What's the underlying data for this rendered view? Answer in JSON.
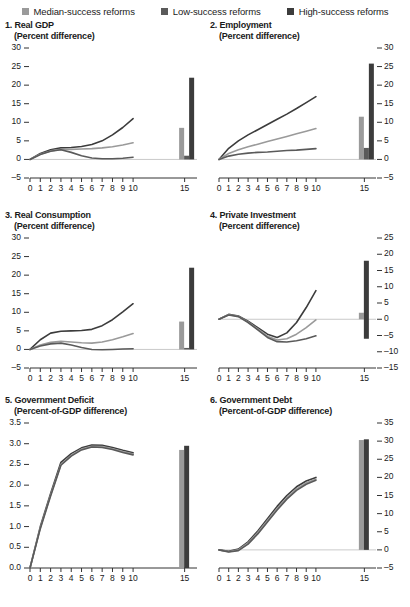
{
  "legend": {
    "items": [
      {
        "label": "Median-success reforms",
        "color": "#9a9a9a",
        "icon": "square-swatch"
      },
      {
        "label": "Low-success reforms",
        "color": "#5a5a5a",
        "icon": "square-swatch"
      },
      {
        "label": "High-success reforms",
        "color": "#3c3c3c",
        "icon": "square-swatch"
      }
    ]
  },
  "chart_data": [
    {
      "type": "line",
      "panel_number": "1.",
      "title": "Real GDP",
      "subtitle": "(Percent difference)",
      "xlabel": "",
      "ylabel": "",
      "axis_side": "left",
      "ylim": [
        -5,
        30
      ],
      "yticks": [
        -5,
        0,
        5,
        10,
        15,
        20,
        25,
        30
      ],
      "ytick_labels": [
        "–5",
        "0",
        "5",
        "10",
        "15",
        "20",
        "25",
        "30"
      ],
      "x": [
        0,
        1,
        2,
        3,
        4,
        5,
        6,
        7,
        8,
        9,
        10
      ],
      "xtick_labels": [
        "0",
        "1",
        "2",
        "3",
        "4",
        "5",
        "6",
        "7",
        "8",
        "9",
        "10",
        "15"
      ],
      "grid": false,
      "legend_position": "top",
      "series": [
        {
          "name": "High-success reforms",
          "color": "#3c3c3c",
          "values": [
            0.0,
            1.6,
            2.6,
            3.1,
            3.2,
            3.5,
            4.0,
            5.0,
            6.6,
            8.6,
            11.0
          ]
        },
        {
          "name": "Median-success reforms",
          "color": "#9a9a9a",
          "values": [
            0.0,
            1.4,
            2.3,
            2.7,
            2.7,
            2.8,
            2.9,
            3.1,
            3.4,
            3.9,
            4.5
          ]
        },
        {
          "name": "Low-success reforms",
          "color": "#5a5a5a",
          "values": [
            0.0,
            1.3,
            2.2,
            2.6,
            1.9,
            1.0,
            0.4,
            0.2,
            0.2,
            0.3,
            0.6
          ]
        }
      ],
      "bars": [
        {
          "name": "Median-success reforms",
          "x": 15,
          "value": 8.5,
          "color": "#9a9a9a"
        },
        {
          "name": "Low-success reforms",
          "x": 15,
          "value": 1.0,
          "color": "#5a5a5a"
        },
        {
          "name": "High-success reforms",
          "x": 15,
          "value": 22.0,
          "color": "#3c3c3c"
        }
      ]
    },
    {
      "type": "line",
      "panel_number": "2.",
      "title": "Employment",
      "subtitle": "(Percent difference)",
      "xlabel": "",
      "ylabel": "",
      "axis_side": "right",
      "ylim": [
        -5,
        30
      ],
      "yticks": [
        -5,
        0,
        5,
        10,
        15,
        20,
        25,
        30
      ],
      "ytick_labels": [
        "–5",
        "0",
        "5",
        "10",
        "15",
        "20",
        "25",
        "30"
      ],
      "x": [
        0,
        1,
        2,
        3,
        4,
        5,
        6,
        7,
        8,
        9,
        10
      ],
      "xtick_labels": [
        "0",
        "1",
        "2",
        "3",
        "4",
        "5",
        "6",
        "7",
        "8",
        "9",
        "10",
        "15"
      ],
      "grid": false,
      "legend_position": "top",
      "series": [
        {
          "name": "High-success reforms",
          "color": "#3c3c3c",
          "values": [
            0.0,
            3.0,
            5.0,
            6.6,
            8.0,
            9.4,
            10.8,
            12.2,
            13.7,
            15.3,
            16.9
          ]
        },
        {
          "name": "Median-success reforms",
          "color": "#9a9a9a",
          "values": [
            0.0,
            1.6,
            2.6,
            3.4,
            4.1,
            4.8,
            5.5,
            6.2,
            6.9,
            7.6,
            8.3
          ]
        },
        {
          "name": "Low-success reforms",
          "color": "#5a5a5a",
          "values": [
            0.0,
            0.9,
            1.4,
            1.7,
            1.9,
            2.0,
            2.2,
            2.4,
            2.5,
            2.7,
            2.9
          ]
        }
      ],
      "bars": [
        {
          "name": "Median-success reforms",
          "x": 15,
          "value": 11.5,
          "color": "#9a9a9a"
        },
        {
          "name": "Low-success reforms",
          "x": 15,
          "value": 3.1,
          "color": "#5a5a5a"
        },
        {
          "name": "High-success reforms",
          "x": 15,
          "value": 25.8,
          "color": "#3c3c3c"
        }
      ]
    },
    {
      "type": "line",
      "panel_number": "3.",
      "title": "Real Consumption",
      "subtitle": "(Percent difference)",
      "xlabel": "",
      "ylabel": "",
      "axis_side": "left",
      "ylim": [
        -5,
        30
      ],
      "yticks": [
        -5,
        0,
        5,
        10,
        15,
        20,
        25,
        30
      ],
      "ytick_labels": [
        "–5",
        "0",
        "5",
        "10",
        "15",
        "20",
        "25",
        "30"
      ],
      "x": [
        0,
        1,
        2,
        3,
        4,
        5,
        6,
        7,
        8,
        9,
        10
      ],
      "xtick_labels": [
        "0",
        "1",
        "2",
        "3",
        "4",
        "5",
        "6",
        "7",
        "8",
        "9",
        "10",
        "15"
      ],
      "grid": false,
      "legend_position": "top",
      "series": [
        {
          "name": "High-success reforms",
          "color": "#3c3c3c",
          "values": [
            0.0,
            2.6,
            4.4,
            4.9,
            5.0,
            5.1,
            5.4,
            6.4,
            8.0,
            10.1,
            12.3
          ]
        },
        {
          "name": "Median-success reforms",
          "color": "#9a9a9a",
          "values": [
            0.0,
            1.2,
            1.9,
            2.2,
            2.0,
            1.8,
            1.7,
            2.0,
            2.6,
            3.4,
            4.3
          ]
        },
        {
          "name": "Low-success reforms",
          "color": "#5a5a5a",
          "values": [
            0.0,
            0.9,
            1.5,
            1.7,
            1.2,
            0.5,
            0.0,
            -0.1,
            0.0,
            0.1,
            0.2
          ]
        }
      ],
      "bars": [
        {
          "name": "Median-success reforms",
          "x": 15,
          "value": 7.5,
          "color": "#9a9a9a"
        },
        {
          "name": "Low-success reforms",
          "x": 15,
          "value": 0.4,
          "color": "#5a5a5a"
        },
        {
          "name": "High-success reforms",
          "x": 15,
          "value": 22.0,
          "color": "#3c3c3c"
        }
      ]
    },
    {
      "type": "line",
      "panel_number": "4.",
      "title": "Private Investment",
      "subtitle": "(Percent difference)",
      "xlabel": "",
      "ylabel": "",
      "axis_side": "right",
      "ylim": [
        -15,
        25
      ],
      "yticks": [
        -15,
        -10,
        -5,
        0,
        5,
        10,
        15,
        20,
        25
      ],
      "ytick_labels": [
        "–15",
        "–10",
        "–5",
        "0",
        "5",
        "10",
        "15",
        "20",
        "25"
      ],
      "x": [
        0,
        1,
        2,
        3,
        4,
        5,
        6,
        7,
        8,
        9,
        10
      ],
      "xtick_labels": [
        "0",
        "1",
        "2",
        "3",
        "4",
        "5",
        "6",
        "7",
        "8",
        "9",
        "10",
        "15"
      ],
      "grid": false,
      "zero_line": true,
      "legend_position": "top",
      "series": [
        {
          "name": "High-success reforms",
          "color": "#3c3c3c",
          "values": [
            0.0,
            1.5,
            1.0,
            -0.6,
            -2.6,
            -4.6,
            -5.6,
            -4.2,
            -1.0,
            3.6,
            8.8
          ]
        },
        {
          "name": "Median-success reforms",
          "color": "#9a9a9a",
          "values": [
            0.0,
            1.4,
            0.9,
            -0.8,
            -3.0,
            -5.2,
            -6.4,
            -6.0,
            -4.6,
            -2.6,
            -0.2
          ]
        },
        {
          "name": "Low-success reforms",
          "color": "#5a5a5a",
          "values": [
            0.0,
            1.3,
            0.8,
            -1.0,
            -3.3,
            -5.6,
            -6.9,
            -7.0,
            -6.6,
            -6.0,
            -5.1
          ]
        }
      ],
      "bars": [
        {
          "name": "Median-success reforms",
          "x": 15,
          "value": 2.0,
          "base": 0,
          "color": "#9a9a9a"
        },
        {
          "name": "High-success reforms",
          "x": 15,
          "value": 18.0,
          "base": -6.0,
          "color": "#3c3c3c"
        }
      ]
    },
    {
      "type": "line",
      "panel_number": "5.",
      "title": "Government Deficit",
      "subtitle": "(Percent-of-GDP difference)",
      "xlabel": "",
      "ylabel": "",
      "axis_side": "left",
      "ylim": [
        0,
        3.5
      ],
      "yticks": [
        0,
        0.5,
        1.0,
        1.5,
        2.0,
        2.5,
        3.0,
        3.5
      ],
      "ytick_labels": [
        "0.0",
        "0.5",
        "1.0",
        "1.5",
        "2.0",
        "2.5",
        "3.0",
        "3.5"
      ],
      "x": [
        0,
        1,
        2,
        3,
        4,
        5,
        6,
        7,
        8,
        9,
        10
      ],
      "xtick_labels": [
        "0",
        "1",
        "2",
        "3",
        "4",
        "5",
        "6",
        "7",
        "8",
        "9",
        "10",
        "15"
      ],
      "grid": false,
      "legend_position": "top",
      "series": [
        {
          "name": "High-success reforms",
          "color": "#3c3c3c",
          "values": [
            0.0,
            1.0,
            1.8,
            2.55,
            2.76,
            2.9,
            2.97,
            2.96,
            2.91,
            2.84,
            2.78
          ]
        },
        {
          "name": "Median-success reforms",
          "color": "#9a9a9a",
          "values": [
            0.0,
            0.97,
            1.76,
            2.5,
            2.72,
            2.87,
            2.94,
            2.93,
            2.88,
            2.81,
            2.75
          ]
        },
        {
          "name": "Low-success reforms",
          "color": "#5a5a5a",
          "values": [
            0.0,
            0.95,
            1.74,
            2.48,
            2.7,
            2.85,
            2.92,
            2.91,
            2.86,
            2.79,
            2.73
          ]
        }
      ],
      "bars": [
        {
          "name": "Median-success reforms",
          "x": 15,
          "value": 2.85,
          "color": "#9a9a9a"
        },
        {
          "name": "High-success reforms",
          "x": 15,
          "value": 2.95,
          "color": "#3c3c3c"
        }
      ]
    },
    {
      "type": "line",
      "panel_number": "6.",
      "title": "Government Debt",
      "subtitle": "(Percent-of-GDP difference)",
      "xlabel": "",
      "ylabel": "",
      "axis_side": "right",
      "ylim": [
        -5,
        35
      ],
      "yticks": [
        -5,
        0,
        5,
        10,
        15,
        20,
        25,
        30,
        35
      ],
      "ytick_labels": [
        "–5",
        "0",
        "5",
        "10",
        "15",
        "20",
        "25",
        "30",
        "35"
      ],
      "x": [
        0,
        1,
        2,
        3,
        4,
        5,
        6,
        7,
        8,
        9,
        10
      ],
      "xtick_labels": [
        "0",
        "1",
        "2",
        "3",
        "4",
        "5",
        "6",
        "7",
        "8",
        "9",
        "10",
        "15"
      ],
      "grid": false,
      "zero_line": true,
      "legend_position": "top",
      "series": [
        {
          "name": "High-success reforms",
          "color": "#3c3c3c",
          "values": [
            0.0,
            -0.4,
            0.2,
            2.2,
            5.2,
            8.6,
            12.0,
            15.0,
            17.4,
            19.0,
            20.0
          ]
        },
        {
          "name": "Median-success reforms",
          "color": "#9a9a9a",
          "values": [
            0.0,
            -0.5,
            0.0,
            1.9,
            4.8,
            8.1,
            11.4,
            14.4,
            16.8,
            18.5,
            19.5
          ]
        },
        {
          "name": "Low-success reforms",
          "color": "#5a5a5a",
          "values": [
            0.0,
            -0.6,
            -0.2,
            1.6,
            4.4,
            7.7,
            11.0,
            14.0,
            16.4,
            18.1,
            19.2
          ]
        }
      ],
      "bars": [
        {
          "name": "Median-success reforms",
          "x": 15,
          "value": 30.3,
          "color": "#9a9a9a"
        },
        {
          "name": "High-success reforms",
          "x": 15,
          "value": 30.5,
          "color": "#3c3c3c"
        }
      ]
    }
  ]
}
